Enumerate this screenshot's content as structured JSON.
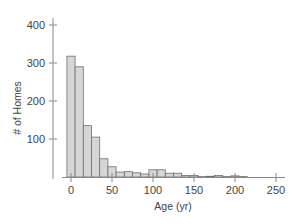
{
  "chart_data": {
    "type": "bar",
    "title": "",
    "xlabel": "Age (yr)",
    "ylabel": "# of Homes",
    "xlim": [
      -10,
      260
    ],
    "ylim": [
      0,
      400
    ],
    "x_ticks": [
      0,
      50,
      100,
      150,
      200,
      250
    ],
    "y_ticks": [
      100,
      200,
      300,
      400
    ],
    "bin_width": 10,
    "bin_starts": [
      -5,
      5,
      15,
      25,
      35,
      45,
      55,
      65,
      75,
      85,
      95,
      105,
      115,
      125,
      135,
      145,
      155,
      165,
      175,
      185,
      195,
      205
    ],
    "values": [
      318,
      290,
      135,
      105,
      48,
      27,
      13,
      14,
      11,
      8,
      19,
      19,
      10,
      10,
      4,
      4,
      1,
      2,
      4,
      1,
      3,
      1
    ],
    "grid": false,
    "legend": null,
    "colors": {
      "bar_fill": "#d6d6d6",
      "bar_stroke": "#6e6e6e",
      "axis": "#888888"
    }
  }
}
